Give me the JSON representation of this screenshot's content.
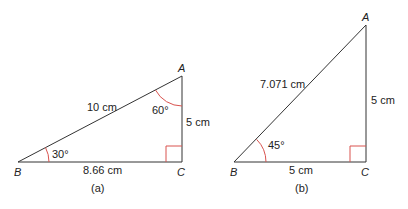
{
  "diagram": {
    "triangle_a": {
      "caption": "(a)",
      "vertices": {
        "A": "A",
        "B": "B",
        "C": "C"
      },
      "hypotenuse_label": "10 cm",
      "adjacent_label": "8.66 cm",
      "opposite_label": "5 cm",
      "angle_B_label": "30°",
      "angle_A_label": "60°"
    },
    "triangle_b": {
      "caption": "(b)",
      "vertices": {
        "A": "A",
        "B": "B",
        "C": "C"
      },
      "hypotenuse_label": "7.071 cm",
      "adjacent_label": "5 cm",
      "opposite_label": "5 cm",
      "angle_B_label": "45°"
    },
    "colors": {
      "line": "#333333",
      "angle_mark": "#d9534f"
    }
  }
}
